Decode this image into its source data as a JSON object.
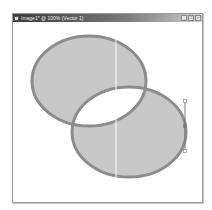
{
  "window": {
    "title": "Image1* @ 100% (Vector 1)",
    "controls": {
      "minimize": "_",
      "maximize": "□",
      "close": "×"
    }
  },
  "canvas": {
    "shapes": [
      {
        "type": "ellipse",
        "name": "ellipse-1",
        "cx": 76,
        "cy": 59,
        "rx": 57,
        "ry": 45
      },
      {
        "type": "ellipse",
        "name": "ellipse-2",
        "cx": 116,
        "cy": 110,
        "rx": 57,
        "ry": 45
      }
    ],
    "fill_rule": "evenodd",
    "guide_x": 103,
    "handle": {
      "x": 172,
      "y1": 79,
      "y2": 129,
      "anchor_y": 104
    },
    "colors": {
      "fill": "#c8c8c8",
      "stroke": "#8c8c8c",
      "guide": "#ffffff",
      "handle": "#7a7a7a"
    }
  }
}
